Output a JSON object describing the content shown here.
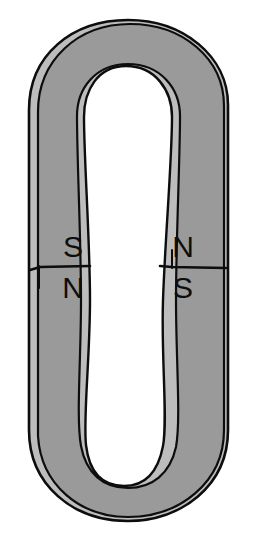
{
  "figure": {
    "shape": "oval ring magnet with elongated inner cavity",
    "background_color": "#ffffff"
  },
  "colors": {
    "body_fill": "#9a9a9a",
    "bevel_highlight": "#bdbdbd",
    "outline": "#0d0d0d",
    "cavity_fill": "#ffffff",
    "label_color": "#0d0d0d"
  },
  "poles": {
    "left_limb": {
      "upper_label": "S",
      "lower_label": "N"
    },
    "right_limb": {
      "upper_label": "N",
      "lower_label": "S"
    }
  },
  "geometry": {
    "divider_y": 266,
    "outer_left_x": 28,
    "outer_right_x": 228,
    "outer_top_y": 20,
    "outer_bottom_y": 520
  }
}
